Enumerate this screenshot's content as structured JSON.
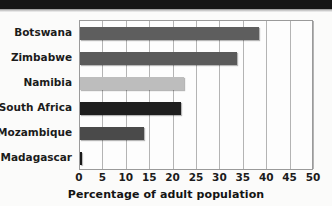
{
  "chart_data": {
    "type": "bar",
    "orientation": "horizontal",
    "title": "",
    "xlabel": "Percentage of adult population",
    "ylabel": "",
    "categories": [
      "Botswana",
      "Zimbabwe",
      "Namibia",
      "South Africa",
      "Mozambique",
      "Madagascar"
    ],
    "values": [
      38.2,
      33.5,
      22.2,
      21.6,
      13.7,
      0.3
    ],
    "bar_colors": [
      "#5e5e5e",
      "#5a5a5a",
      "#bdbdbd",
      "#1e1e1e",
      "#4a4a4a",
      "#1a1a1a"
    ],
    "xlim": [
      0,
      50
    ],
    "xticks": [
      0,
      5,
      10,
      15,
      20,
      25,
      30,
      35,
      40,
      45,
      50
    ],
    "xtick_labels": [
      "0",
      "5",
      "10",
      "15",
      "20",
      "25",
      "30",
      "35",
      "40",
      "45",
      "50"
    ],
    "grid": "vertical",
    "legend": "none"
  },
  "axis": {
    "x_title": "Percentage of adult population"
  },
  "colors": {
    "frame": "#9a9a9a",
    "gridline": "#b4b4b4",
    "plot_background": "#fdfdfd",
    "page_background": "#fbfbfa",
    "text": "#1b1b1b",
    "top_band": "#151515"
  }
}
